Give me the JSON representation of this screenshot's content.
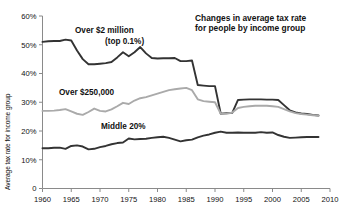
{
  "chart_data": {
    "type": "line",
    "title": "Changes in average tax rate\nfor people by income group",
    "title_line1": "Changes in average tax rate",
    "title_line2": "for people by income group",
    "xlabel": "",
    "ylabel": "Average tax rate for income group",
    "xlim": [
      1960,
      2010
    ],
    "ylim": [
      0,
      60
    ],
    "grid": false,
    "legend_position": "inline-annotations",
    "x_ticks": [
      1960,
      1965,
      1970,
      1975,
      1980,
      1985,
      1990,
      1995,
      2000,
      2005,
      2010
    ],
    "x_tick_labels": [
      "1960",
      "1965",
      "1970",
      "1975",
      "1980",
      "1985",
      "1990",
      "1995",
      "2000",
      "2005",
      "2010"
    ],
    "y_ticks": [
      0,
      10,
      20,
      30,
      40,
      50,
      60
    ],
    "y_tick_labels": [
      "0",
      "10%",
      "20%",
      "30%",
      "40%",
      "50%",
      "60%"
    ],
    "x": [
      1960,
      1961,
      1962,
      1963,
      1964,
      1965,
      1966,
      1967,
      1968,
      1969,
      1970,
      1971,
      1972,
      1973,
      1974,
      1975,
      1976,
      1977,
      1978,
      1979,
      1980,
      1981,
      1982,
      1983,
      1984,
      1985,
      1986,
      1987,
      1988,
      1989,
      1990,
      1991,
      1992,
      1993,
      1994,
      1995,
      1996,
      1997,
      1998,
      1999,
      2000,
      2001,
      2002,
      2003,
      2004,
      2005,
      2006,
      2007,
      2008
    ],
    "series": [
      {
        "name": "Over $2 million (top 0.1%)",
        "label_line1": "Over $2 million",
        "label_line2": "(top 0.1%)",
        "color": "#333333",
        "width": 1.9,
        "values": [
          51.0,
          51.2,
          51.3,
          51.3,
          51.8,
          51.5,
          48.0,
          45.0,
          43.2,
          43.2,
          43.4,
          43.6,
          44.0,
          45.6,
          47.4,
          46.0,
          47.4,
          49.2,
          47.0,
          45.4,
          45.2,
          45.3,
          45.3,
          45.4,
          44.3,
          44.3,
          44.5,
          36.0,
          35.8,
          35.6,
          35.6,
          26.0,
          26.2,
          26.3,
          30.8,
          30.9,
          31.0,
          31.0,
          31.0,
          30.9,
          30.9,
          30.8,
          29.0,
          27.2,
          26.5,
          26.1,
          25.9,
          25.6,
          25.4
        ]
      },
      {
        "name": "Over $250,000",
        "label": "Over $250,000",
        "color": "#aaaaaa",
        "width": 1.9,
        "values": [
          27.0,
          27.0,
          27.1,
          27.3,
          27.6,
          26.8,
          26.0,
          25.6,
          26.6,
          27.8,
          27.0,
          26.8,
          27.5,
          28.6,
          29.8,
          29.4,
          30.6,
          31.4,
          31.8,
          32.4,
          33.0,
          33.6,
          34.2,
          34.5,
          34.8,
          35.0,
          34.2,
          31.0,
          30.4,
          30.2,
          30.0,
          26.0,
          26.0,
          26.4,
          28.0,
          28.4,
          28.6,
          28.8,
          28.8,
          28.8,
          28.6,
          28.4,
          27.6,
          26.8,
          26.2,
          25.9,
          25.7,
          25.5,
          25.3
        ]
      },
      {
        "name": "Middle 20%",
        "label": "Middle 20%",
        "color": "#333333",
        "width": 1.9,
        "values": [
          14.0,
          14.0,
          14.2,
          14.2,
          13.8,
          14.8,
          15.0,
          14.6,
          13.6,
          13.8,
          14.4,
          14.8,
          15.4,
          15.8,
          16.0,
          17.4,
          17.1,
          17.2,
          17.3,
          17.6,
          17.8,
          18.0,
          17.6,
          17.0,
          16.4,
          16.8,
          17.0,
          17.8,
          18.4,
          18.8,
          19.4,
          19.8,
          19.4,
          19.4,
          19.5,
          19.4,
          19.4,
          19.4,
          19.6,
          19.4,
          19.5,
          18.6,
          18.0,
          17.6,
          17.7,
          17.8,
          17.9,
          17.9,
          17.9
        ]
      }
    ],
    "annotations": [
      {
        "text": "Over $2 million",
        "series": "Over $2 million (top 0.1%)"
      },
      {
        "text": "(top 0.1%)",
        "series": "Over $2 million (top 0.1%)"
      },
      {
        "text": "Over $250,000",
        "series": "Over $250,000"
      },
      {
        "text": "Middle 20%",
        "series": "Middle 20%"
      }
    ]
  }
}
